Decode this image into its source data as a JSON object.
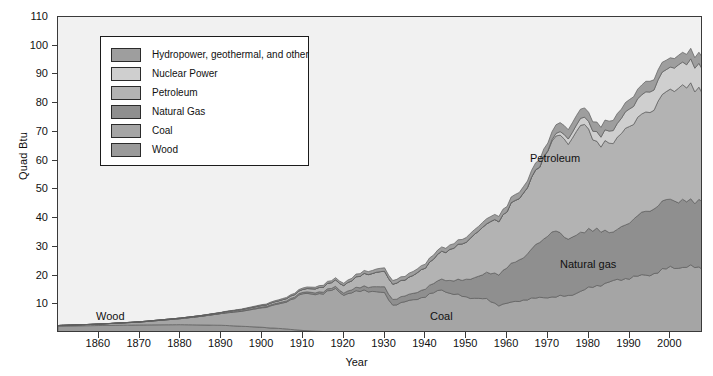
{
  "chart_data": {
    "type": "area",
    "stacked": true,
    "title": "",
    "xlabel": "Year",
    "ylabel": "Quad Btu",
    "xlim": [
      1850,
      2008
    ],
    "ylim": [
      0,
      110
    ],
    "xticks": [
      1860,
      1870,
      1880,
      1890,
      1900,
      1910,
      1920,
      1930,
      1940,
      1950,
      1960,
      1970,
      1980,
      1990,
      2000
    ],
    "yticks": [
      10,
      20,
      30,
      40,
      50,
      60,
      70,
      80,
      90,
      100,
      110
    ],
    "grid": false,
    "legend_position": "upper-left-inside",
    "plot_background": "#f1f1f1",
    "axis_color": "#3a3a3a",
    "series": [
      {
        "name": "Wood",
        "legend_label": "Wood",
        "color": "#9a9a9a",
        "annotation": "Wood",
        "x": [
          1850,
          1860,
          1870,
          1880,
          1890,
          1900,
          1905,
          1910,
          1915,
          1920,
          1930,
          1940,
          1950,
          1960,
          1970,
          1980,
          1990,
          2000,
          2008
        ],
        "values": [
          2.4,
          2.6,
          2.8,
          2.9,
          2.7,
          2.0,
          1.5,
          0.9,
          0.5,
          0.3,
          0.2,
          0.2,
          0.2,
          0.2,
          0.2,
          0.2,
          0.2,
          0.2,
          0.2
        ]
      },
      {
        "name": "Coal",
        "legend_label": "Coal",
        "color": "#a5a5a5",
        "annotation": "Coal",
        "x": [
          1850,
          1860,
          1870,
          1880,
          1885,
          1890,
          1895,
          1900,
          1905,
          1910,
          1915,
          1918,
          1920,
          1925,
          1930,
          1932,
          1935,
          1940,
          1944,
          1946,
          1950,
          1955,
          1958,
          1960,
          1965,
          1970,
          1975,
          1980,
          1985,
          1990,
          1995,
          2000,
          2005,
          2008
        ],
        "values": [
          0.2,
          0.5,
          1.0,
          2.1,
          3.0,
          4.1,
          5.2,
          6.8,
          8.8,
          12.7,
          13.2,
          15.0,
          13.0,
          14.7,
          13.6,
          9.5,
          10.6,
          12.5,
          15.0,
          13.6,
          12.3,
          11.5,
          9.5,
          10.1,
          11.6,
          12.3,
          12.7,
          15.4,
          17.5,
          19.1,
          20.1,
          22.6,
          22.8,
          22.4
        ]
      },
      {
        "name": "Natural Gas",
        "legend_label": "Natural Gas",
        "color": "#8f8f8f",
        "annotation": "Natural gas",
        "x": [
          1890,
          1900,
          1910,
          1920,
          1930,
          1935,
          1940,
          1945,
          1950,
          1955,
          1960,
          1965,
          1970,
          1972,
          1975,
          1980,
          1985,
          1986,
          1990,
          1995,
          2000,
          2005,
          2008
        ],
        "values": [
          0.1,
          0.3,
          0.5,
          0.8,
          2.0,
          2.0,
          2.7,
          4.0,
          6.0,
          9.0,
          12.4,
          15.8,
          21.8,
          22.7,
          19.9,
          20.4,
          17.8,
          16.7,
          19.6,
          22.7,
          23.8,
          22.6,
          23.8
        ]
      },
      {
        "name": "Petroleum",
        "legend_label": "Petroleum",
        "color": "#b3b3b3",
        "annotation": "Petroleum",
        "x": [
          1860,
          1870,
          1880,
          1890,
          1900,
          1910,
          1915,
          1920,
          1925,
          1930,
          1935,
          1940,
          1945,
          1950,
          1955,
          1960,
          1965,
          1970,
          1973,
          1975,
          1978,
          1979,
          1980,
          1982,
          1983,
          1985,
          1990,
          1995,
          2000,
          2005,
          2008
        ],
        "values": [
          0.0,
          0.1,
          0.2,
          0.3,
          0.5,
          1.0,
          1.7,
          2.6,
          4.3,
          5.4,
          5.6,
          7.5,
          10.1,
          13.3,
          17.3,
          19.9,
          23.2,
          29.5,
          34.8,
          32.7,
          37.9,
          37.1,
          34.2,
          30.2,
          30.1,
          30.9,
          33.6,
          34.4,
          38.4,
          40.4,
          37.3
        ]
      },
      {
        "name": "Nuclear Power",
        "legend_label": "Nuclear Power",
        "color": "#cfcfcf",
        "annotation": "",
        "x": [
          1957,
          1960,
          1965,
          1970,
          1975,
          1980,
          1985,
          1990,
          1995,
          2000,
          2005,
          2008
        ],
        "values": [
          0.0,
          0.0,
          0.0,
          0.2,
          1.9,
          2.7,
          4.1,
          6.1,
          7.1,
          7.9,
          8.2,
          8.4
        ]
      },
      {
        "name": "Hydropower, geothermal, and other",
        "legend_label": "Hydropower, geothermal, and other",
        "color": "#9e9e9e",
        "annotation": "",
        "x": [
          1880,
          1890,
          1900,
          1910,
          1920,
          1930,
          1940,
          1950,
          1960,
          1970,
          1975,
          1980,
          1985,
          1990,
          1995,
          2000,
          2005,
          2008
        ],
        "values": [
          0.0,
          0.1,
          0.3,
          0.5,
          0.8,
          1.2,
          1.4,
          1.6,
          1.9,
          2.7,
          3.3,
          3.2,
          3.5,
          3.2,
          3.7,
          3.2,
          3.6,
          4.1
        ]
      }
    ],
    "annotations": [
      {
        "label": "Wood",
        "x_px": 96,
        "y_px": 310
      },
      {
        "label": "Coal",
        "x_px": 430,
        "y_px": 310
      },
      {
        "label": "Petroleum",
        "x_px": 530,
        "y_px": 152
      },
      {
        "label": "Natural gas",
        "x_px": 560,
        "y_px": 258
      }
    ],
    "total_peak": {
      "year": 2007,
      "value": 101.5
    }
  },
  "legend": {
    "items": [
      {
        "label": "Hydropower, geothermal, and other",
        "color": "#9e9e9e"
      },
      {
        "label": "Nuclear Power",
        "color": "#cfcfcf"
      },
      {
        "label": "Petroleum",
        "color": "#b3b3b3"
      },
      {
        "label": "Natural Gas",
        "color": "#8f8f8f"
      },
      {
        "label": "Coal",
        "color": "#a5a5a5"
      },
      {
        "label": "Wood",
        "color": "#9a9a9a"
      }
    ]
  }
}
